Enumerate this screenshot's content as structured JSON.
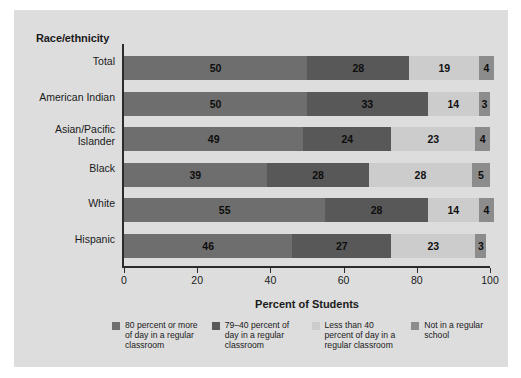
{
  "figure": {
    "panel_color": "#dddddd",
    "page_color": "#ffffff"
  },
  "yaxis": {
    "header": "Race/ethnicity"
  },
  "xaxis": {
    "title": "Percent of Students",
    "ticks": [
      "0",
      "20",
      "40",
      "60",
      "80",
      "100"
    ]
  },
  "legend": {
    "items": [
      {
        "label": "80 percent or more of day in a regular classroom",
        "color": "#6e6e6e",
        "swatch_name": "legend-swatch-80-or-more"
      },
      {
        "label": "79–40 percent of day in a regular classroom",
        "color": "#585858",
        "swatch_name": "legend-swatch-79-40"
      },
      {
        "label": "Less than 40 percent of day in a regular classroom",
        "color": "#cccccc",
        "swatch_name": "legend-swatch-less-than-40"
      },
      {
        "label": "Not in a regular school",
        "color": "#8c8c8c",
        "swatch_name": "legend-swatch-not-regular-school"
      }
    ]
  },
  "chart_data": {
    "type": "bar",
    "orientation": "horizontal",
    "stacked": true,
    "title": "",
    "xlabel": "Percent of Students",
    "ylabel": "Race/ethnicity",
    "xlim": [
      0,
      100
    ],
    "xticks": [
      0,
      20,
      40,
      60,
      80,
      100
    ],
    "grid": false,
    "legend_position": "bottom",
    "categories": [
      "Total",
      "American Indian",
      "Asian/Pacific\nIslander",
      "Black",
      "White",
      "Hispanic"
    ],
    "series": [
      {
        "name": "80 percent or more of day in a regular classroom",
        "color": "#6e6e6e",
        "values": [
          50,
          50,
          49,
          39,
          55,
          46
        ]
      },
      {
        "name": "79–40 percent of day in a regular classroom",
        "color": "#585858",
        "values": [
          28,
          33,
          24,
          28,
          28,
          27
        ]
      },
      {
        "name": "Less than 40 percent of day in a regular classroom",
        "color": "#cccccc",
        "values": [
          19,
          14,
          23,
          28,
          14,
          23
        ]
      },
      {
        "name": "Not in a regular school",
        "color": "#8c8c8c",
        "values": [
          4,
          3,
          4,
          5,
          4,
          3
        ]
      }
    ]
  }
}
